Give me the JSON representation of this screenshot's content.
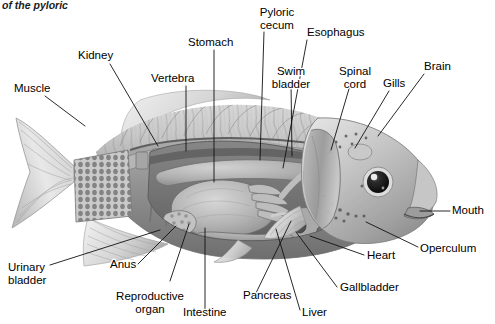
{
  "figure": {
    "kind": "anatomical-illustration",
    "style": "grayscale pencil/airbrush rendering",
    "background_color": "#ffffff",
    "label_text_color": "#000000",
    "leader_line_color": "#111111",
    "canvas": {
      "width": 495,
      "height": 324
    }
  },
  "caption_fragment": {
    "text": "of the pyloric",
    "note": "clipped italic caption text at top edge"
  },
  "labels": [
    {
      "id": "muscle",
      "text": "Muscle",
      "x": 14,
      "y": 92,
      "anchor": "start",
      "lines": [
        "Muscle"
      ]
    },
    {
      "id": "kidney",
      "text": "Kidney",
      "x": 78,
      "y": 59,
      "anchor": "start",
      "lines": [
        "Kidney"
      ]
    },
    {
      "id": "vertebra",
      "text": "Vertebra",
      "x": 151,
      "y": 82,
      "anchor": "start",
      "lines": [
        "Vertebra"
      ]
    },
    {
      "id": "stomach",
      "text": "Stomach",
      "x": 188,
      "y": 46,
      "anchor": "start",
      "lines": [
        "Stomach"
      ]
    },
    {
      "id": "pyloric-cecum",
      "text": "Pyloric cecum",
      "x": 277,
      "y": 16,
      "anchor": "middle",
      "lines": [
        "Pyloric",
        "cecum"
      ]
    },
    {
      "id": "esophagus",
      "text": "Esophagus",
      "x": 307,
      "y": 36,
      "anchor": "start",
      "lines": [
        "Esophagus"
      ]
    },
    {
      "id": "swim-bladder",
      "text": "Swim bladder",
      "x": 291,
      "y": 75,
      "anchor": "middle",
      "lines": [
        "Swim",
        "bladder"
      ]
    },
    {
      "id": "spinal-cord",
      "text": "Spinal cord",
      "x": 355,
      "y": 75,
      "anchor": "middle",
      "lines": [
        "Spinal",
        "cord"
      ]
    },
    {
      "id": "gills",
      "text": "Gills",
      "x": 383,
      "y": 87,
      "anchor": "start",
      "lines": [
        "Gills"
      ]
    },
    {
      "id": "brain",
      "text": "Brain",
      "x": 424,
      "y": 70,
      "anchor": "start",
      "lines": [
        "Brain"
      ]
    },
    {
      "id": "mouth",
      "text": "Mouth",
      "x": 452,
      "y": 214,
      "anchor": "start",
      "lines": [
        "Mouth"
      ]
    },
    {
      "id": "operculum",
      "text": "Operculum",
      "x": 420,
      "y": 252,
      "anchor": "start",
      "lines": [
        "Operculum"
      ]
    },
    {
      "id": "heart",
      "text": "Heart",
      "x": 367,
      "y": 259,
      "anchor": "start",
      "lines": [
        "Heart"
      ]
    },
    {
      "id": "gallbladder",
      "text": "Gallbladder",
      "x": 340,
      "y": 291,
      "anchor": "start",
      "lines": [
        "Gallbladder"
      ]
    },
    {
      "id": "liver",
      "text": "Liver",
      "x": 302,
      "y": 316,
      "anchor": "start",
      "lines": [
        "Liver"
      ]
    },
    {
      "id": "pancreas",
      "text": "Pancreas",
      "x": 243,
      "y": 299,
      "anchor": "start",
      "lines": [
        "Pancreas"
      ]
    },
    {
      "id": "intestine",
      "text": "Intestine",
      "x": 183,
      "y": 316,
      "anchor": "start",
      "lines": [
        "Intestine"
      ]
    },
    {
      "id": "reproductive-organ",
      "text": "Reproductive organ",
      "x": 139,
      "y": 300,
      "anchor": "middle",
      "lines": [
        "Reproductive",
        "organ"
      ]
    },
    {
      "id": "anus",
      "text": "Anus",
      "x": 110,
      "y": 268,
      "anchor": "start",
      "lines": [
        "Anus"
      ]
    },
    {
      "id": "urinary-bladder",
      "text": "Urinary bladder",
      "x": 8,
      "y": 271,
      "anchor": "start",
      "lines": [
        "Urinary",
        "bladder"
      ]
    }
  ],
  "leaders": [
    {
      "id": "muscle",
      "points": "45,96 85,126"
    },
    {
      "id": "kidney",
      "points": "110,64 158,146"
    },
    {
      "id": "vertebra",
      "points": "186,86 186,151"
    },
    {
      "id": "stomach",
      "points": "214,50 214,182"
    },
    {
      "id": "pyloric-cecum",
      "points": "264,32 260,160"
    },
    {
      "id": "esophagus",
      "points": "307,40 283,168"
    },
    {
      "id": "swim-bladder",
      "points": "291,82 292,156"
    },
    {
      "id": "spinal-cord",
      "points": "351,82 331,150"
    },
    {
      "id": "gills",
      "points": "389,91 355,148"
    },
    {
      "id": "brain",
      "points": "424,74 378,136"
    },
    {
      "id": "mouth",
      "points": "450,211 420,211"
    },
    {
      "id": "operculum",
      "points": "418,247 366,222"
    },
    {
      "id": "heart",
      "points": "364,255 310,236"
    },
    {
      "id": "gallbladder",
      "points": "337,287 296,232"
    },
    {
      "id": "liver",
      "points": "300,310 276,229"
    },
    {
      "id": "pancreas",
      "points": "256,293 291,221"
    },
    {
      "id": "intestine",
      "points": "205,310 205,228"
    },
    {
      "id": "reproductive-organ",
      "points": "170,281 189,224"
    },
    {
      "id": "anus",
      "points": "138,264 176,226"
    },
    {
      "id": "urinary-bladder",
      "points": "50,265 160,230"
    }
  ]
}
